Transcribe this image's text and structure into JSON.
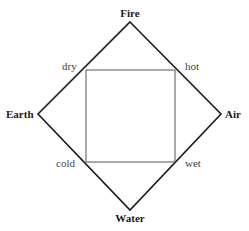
{
  "diagram": {
    "type": "four-elements-square-of-opposition",
    "elements": {
      "top": "Fire",
      "left": "Earth",
      "right": "Air",
      "bottom": "Water"
    },
    "qualities": {
      "top_left": "dry",
      "top_right": "hot",
      "bottom_left": "cold",
      "bottom_right": "wet"
    },
    "colors": {
      "outer_diamond": "#1a1a1a",
      "inner_square": "#555555",
      "background": "#ffffff"
    }
  }
}
